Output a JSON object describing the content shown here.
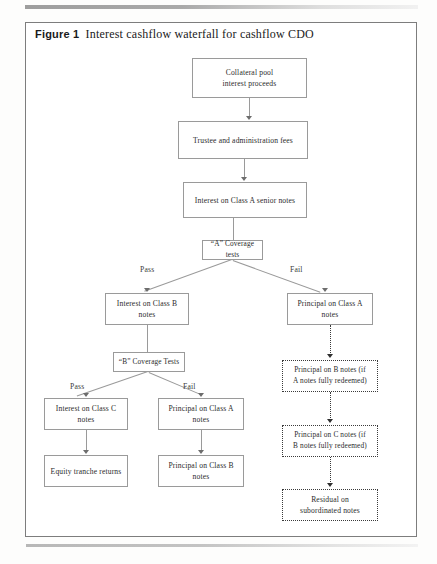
{
  "figure": {
    "label": "Figure 1",
    "title": "Interest cashflow waterfall for cashflow CDO"
  },
  "colors": {
    "box_border": "#9a9a9a",
    "dotted_border": "#3a3a3a",
    "frame_border": "#7d7d7d",
    "text": "#2b2b2b",
    "background": "#ffffff"
  },
  "diagram": {
    "type": "flowchart",
    "nodes": [
      {
        "id": "collateral",
        "text": "Collateral pool\ninterest proceeds",
        "style": "solid"
      },
      {
        "id": "trustee",
        "text": "Trustee and administration fees",
        "style": "solid"
      },
      {
        "id": "int_a",
        "text": "Interest on Class A senior notes",
        "style": "solid"
      },
      {
        "id": "a_tests",
        "text": "“A” Coverage tests",
        "style": "solid"
      },
      {
        "id": "int_b",
        "text": "Interest on Class B\nnotes",
        "style": "solid"
      },
      {
        "id": "prin_a_right",
        "text": "Principal on Class A\nnotes",
        "style": "solid"
      },
      {
        "id": "b_tests",
        "text": "“B” Coverage Tests",
        "style": "solid"
      },
      {
        "id": "int_c",
        "text": "Interest on Class C\nnotes",
        "style": "solid"
      },
      {
        "id": "prin_a_mid",
        "text": "Principal on Class A\nnotes",
        "style": "solid"
      },
      {
        "id": "equity",
        "text": "Equity tranche returns",
        "style": "solid"
      },
      {
        "id": "prin_b_mid",
        "text": "Principal on Class B\nnotes",
        "style": "solid"
      },
      {
        "id": "prin_b_dot",
        "text": "Principal on B notes (if\nA notes fully redeemed)",
        "style": "dotted"
      },
      {
        "id": "prin_c_dot",
        "text": "Principal on C notes (if\nB notes fully redeemed)",
        "style": "dotted"
      },
      {
        "id": "residual",
        "text": "Residual on\nsubordinated notes",
        "style": "dotted"
      }
    ],
    "edge_labels": {
      "a_pass": "Pass",
      "a_fail": "Fail",
      "b_pass": "Pass",
      "b_fail": "Fail"
    }
  }
}
